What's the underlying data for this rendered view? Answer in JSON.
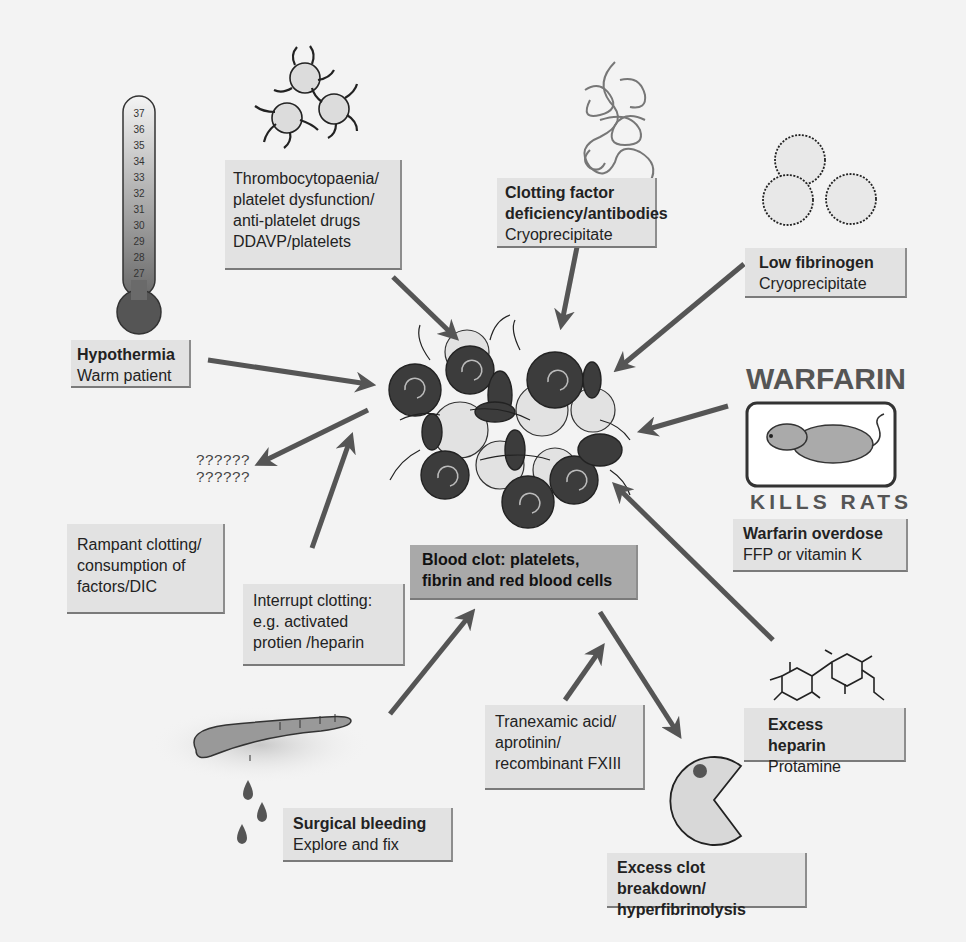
{
  "diagram": {
    "center": {
      "title_line1": "Blood clot: platelets,",
      "title_line2": "fibrin and red blood cells"
    },
    "nodes": [
      {
        "id": "hypothermia",
        "heading": "Hypothermia",
        "treatment": "Warm patient"
      },
      {
        "id": "thrombocytopaenia",
        "lines": [
          "Thrombocytopaenia/",
          "platelet dysfunction/",
          "anti-platelet drugs",
          "DDAVP/platelets"
        ]
      },
      {
        "id": "clotting-factor",
        "heading_line1": "Clotting factor",
        "heading_line2": "deficiency/antibodies",
        "treatment": "Cryoprecipitate"
      },
      {
        "id": "low-fibrinogen",
        "heading": "Low fibrinogen",
        "treatment": "Cryoprecipitate"
      },
      {
        "id": "warfarin",
        "icon_title": "WARFARIN",
        "icon_subtitle": "KILLS RATS",
        "heading": "Warfarin overdose",
        "treatment": "FFP or vitamin K"
      },
      {
        "id": "excess-heparin",
        "heading": "Excess heparin",
        "treatment": "Protamine"
      },
      {
        "id": "hyperfibrinolysis",
        "heading_line1": "Excess clot breakdown/",
        "heading_line2": "hyperfibrinolysis"
      },
      {
        "id": "tranexamic",
        "lines": [
          "Tranexamic acid/",
          "aprotinin/",
          "recombinant FXIII"
        ]
      },
      {
        "id": "surgical-bleeding",
        "heading": "Surgical bleeding",
        "treatment": "Explore and fix"
      },
      {
        "id": "interrupt-clotting",
        "lines": [
          "Interrupt clotting:",
          "e.g. activated",
          "protien /heparin"
        ]
      },
      {
        "id": "rampant-clotting",
        "lines": [
          "Rampant clotting/",
          "consumption of",
          "factors/DIC"
        ]
      },
      {
        "id": "unknown",
        "lines": [
          "??????",
          "??????"
        ]
      }
    ],
    "thermometer": {
      "ticks": [
        "37",
        "36",
        "35",
        "34",
        "33",
        "32",
        "31",
        "30",
        "29",
        "28",
        "27"
      ]
    },
    "colors": {
      "background": "#f3f3f3",
      "box_fill": "#e2e2e2",
      "center_box_fill": "#a9a9a9",
      "arrow": "#555555",
      "red_cell": "#3c3c3c",
      "platelet": "#e0e0e0"
    }
  }
}
